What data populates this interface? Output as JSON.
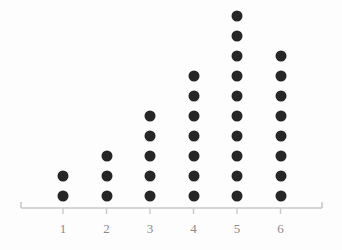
{
  "chart_data": {
    "type": "scatter",
    "plot_style": "dot-plot",
    "title": "",
    "subtitle": "",
    "xlabel": "",
    "ylabel": "",
    "categories": [
      "1",
      "2",
      "3",
      "4",
      "5",
      "6"
    ],
    "values": [
      2,
      3,
      5,
      7,
      10,
      8
    ],
    "series": [
      {
        "name": "",
        "values": [
          2,
          3,
          5,
          7,
          10,
          8
        ]
      }
    ],
    "tick_labels": [
      "1",
      "2",
      "3",
      "4",
      "5",
      "6"
    ],
    "legend": [],
    "legend_position": "none",
    "grid": false,
    "xlim": [
      0.5,
      6.5
    ],
    "ylim": [
      0,
      10
    ],
    "annotations": [],
    "colors": {
      "dot": "#262626",
      "axis": "#c9c9c9",
      "tick_label": "#8a8a8a",
      "background": "#fdfdfd"
    },
    "axis": {
      "x_start_px": 21,
      "x_end_px": 322,
      "y_px": 208,
      "has_end_caps": true,
      "has_ticks": true
    },
    "geometry": {
      "dot_diameter_px": 11,
      "column_spacing_px": 43.5,
      "row_spacing_px": 20,
      "first_column_x_px": 63,
      "baseline_dot_y_px": 196,
      "label_y_px": 222
    }
  }
}
